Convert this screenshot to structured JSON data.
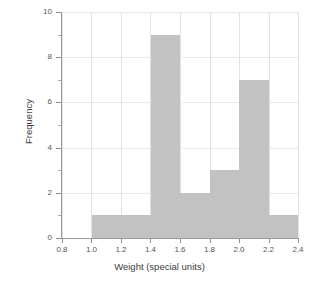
{
  "chart_data": {
    "type": "bar",
    "title": "",
    "subtitle": "",
    "xlabel": "Weight (special units)",
    "ylabel": "Frequency",
    "xlim": [
      0.8,
      2.4
    ],
    "ylim": [
      0,
      10
    ],
    "grid": true,
    "legend": null,
    "bar_color": "#c2c2c2",
    "axis_color": "#9a9a9a",
    "grid_color": "#e2e2e2",
    "xticks": [
      "0.8",
      "1.0",
      "1.2",
      "1.4",
      "1.6",
      "1.8",
      "2.0",
      "2.2",
      "2.4"
    ],
    "xtick_values": [
      0.8,
      1.0,
      1.2,
      1.4,
      1.6,
      1.8,
      2.0,
      2.2,
      2.4
    ],
    "yticks": [
      "0",
      "2",
      "4",
      "6",
      "8",
      "10"
    ],
    "ytick_values": [
      0,
      2,
      4,
      6,
      8,
      10
    ],
    "yminor_values": [
      1,
      3,
      5,
      7,
      9
    ],
    "bins": [
      {
        "start": 1.0,
        "end": 1.4,
        "frequency": 1
      },
      {
        "start": 1.4,
        "end": 1.6,
        "frequency": 9
      },
      {
        "start": 1.6,
        "end": 1.8,
        "frequency": 2
      },
      {
        "start": 1.8,
        "end": 2.0,
        "frequency": 3
      },
      {
        "start": 2.0,
        "end": 2.2,
        "frequency": 7
      },
      {
        "start": 2.2,
        "end": 2.4,
        "frequency": 1
      }
    ],
    "categories": [
      "1.0-1.4",
      "1.4-1.6",
      "1.6-1.8",
      "1.8-2.0",
      "2.0-2.2",
      "2.2-2.4"
    ],
    "values": [
      1,
      9,
      2,
      3,
      7,
      1
    ]
  }
}
